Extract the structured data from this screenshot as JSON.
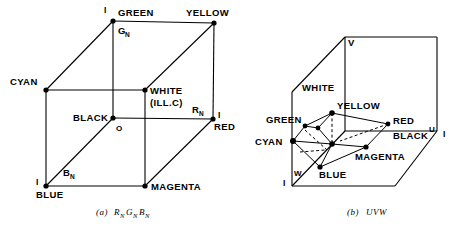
{
  "figure": {
    "title_a": "(a)",
    "title_b": "(b)",
    "caption_a_main": "R",
    "caption_a_sub1": "N",
    "caption_a_mid": "G",
    "caption_a_sub2": "N",
    "caption_a_end": "B",
    "caption_a_sub3": "N",
    "caption_b": "UVW"
  },
  "diagram_a": {
    "name": "RGB normalized color cube",
    "vertices": [
      {
        "key": "green",
        "label": "GREEN",
        "x": 113,
        "y": 21,
        "dot": true
      },
      {
        "key": "yellow",
        "label": "YELLOW",
        "x": 214,
        "y": 23,
        "dot": true
      },
      {
        "key": "cyan",
        "label": "CYAN",
        "x": 46,
        "y": 90,
        "dot": true
      },
      {
        "key": "white",
        "label": "WHITE",
        "x": 145,
        "y": 90,
        "dot": true
      },
      {
        "key": "black",
        "label": "BLACK",
        "x": 113,
        "y": 118,
        "dot": true
      },
      {
        "key": "red",
        "label": "RED",
        "x": 213,
        "y": 119,
        "dot": true
      },
      {
        "key": "blue",
        "label": "BLUE",
        "x": 46,
        "y": 186,
        "dot": true
      },
      {
        "key": "magenta",
        "label": "MAGENTA",
        "x": 145,
        "y": 186,
        "dot": true
      }
    ],
    "extra_labels": {
      "white_second_line": "(ILL.C)",
      "origin": "O",
      "gn": "G",
      "gn_sub": "N",
      "rn": "R",
      "rn_sub": "N",
      "bn": "B",
      "bn_sub": "N",
      "unit_green": "I",
      "unit_red": "I",
      "unit_blue": "I"
    }
  },
  "diagram_b": {
    "name": "UVW color space cube",
    "axis_labels": {
      "v": "V",
      "u": "U",
      "w": "W",
      "unit_u": "I",
      "unit_w": "I"
    },
    "vertices": [
      {
        "key": "white",
        "label": "WHITE",
        "dot": false
      },
      {
        "key": "yellow",
        "label": "YELLOW",
        "dot": true
      },
      {
        "key": "green",
        "label": "GREEN",
        "dot": true
      },
      {
        "key": "red",
        "label": "RED",
        "dot": true
      },
      {
        "key": "cyan",
        "label": "CYAN",
        "dot": true
      },
      {
        "key": "magenta",
        "label": "MAGENTA",
        "dot": true
      },
      {
        "key": "blue",
        "label": "BLUE",
        "dot": true
      },
      {
        "key": "black",
        "label": "BLACK",
        "dot": true
      }
    ]
  },
  "colors": {
    "ink": "#000000",
    "paper": "#ffffff"
  }
}
